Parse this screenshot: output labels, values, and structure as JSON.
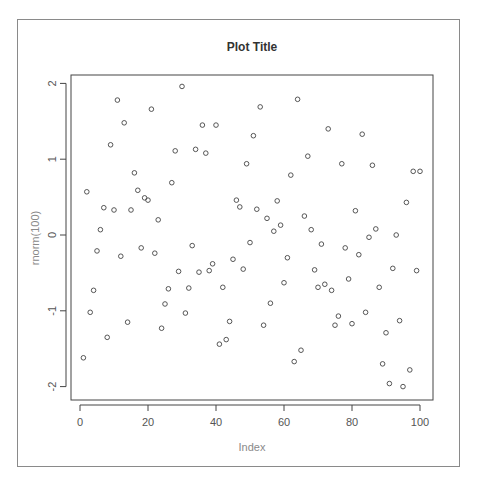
{
  "chart_data": {
    "type": "scatter",
    "title": "Plot Title",
    "xlabel": "Index",
    "ylabel": "rnorm(100)",
    "xlim": [
      -3,
      104
    ],
    "ylim": [
      -2.2,
      2.2
    ],
    "xticks": [
      0,
      20,
      40,
      60,
      80,
      100
    ],
    "yticks": [
      -2,
      -1,
      0,
      1,
      2
    ],
    "grid": false,
    "legend": null,
    "marker": "open-circle",
    "x": [
      1,
      2,
      3,
      4,
      5,
      6,
      7,
      8,
      9,
      10,
      11,
      12,
      13,
      14,
      15,
      16,
      17,
      18,
      19,
      20,
      21,
      22,
      23,
      24,
      25,
      26,
      27,
      28,
      29,
      30,
      31,
      32,
      33,
      34,
      35,
      36,
      37,
      38,
      39,
      40,
      41,
      42,
      43,
      44,
      45,
      46,
      47,
      48,
      49,
      50,
      51,
      52,
      53,
      54,
      55,
      56,
      57,
      58,
      59,
      60,
      61,
      62,
      63,
      64,
      65,
      66,
      67,
      68,
      69,
      70,
      71,
      72,
      73,
      74,
      75,
      76,
      77,
      78,
      79,
      80,
      81,
      82,
      83,
      84,
      85,
      86,
      87,
      88,
      89,
      90,
      91,
      92,
      93,
      94,
      95,
      96,
      97,
      98,
      99,
      100
    ],
    "y": [
      -1.62,
      0.57,
      -1.02,
      -0.73,
      -0.21,
      0.07,
      0.36,
      -1.35,
      1.19,
      0.33,
      1.78,
      -0.28,
      1.48,
      -1.15,
      0.33,
      0.82,
      0.59,
      -0.17,
      0.49,
      0.46,
      1.66,
      -0.24,
      0.2,
      -1.23,
      -0.91,
      -0.71,
      0.69,
      1.11,
      -0.48,
      1.96,
      -1.03,
      -0.7,
      -0.14,
      1.13,
      -0.49,
      1.45,
      1.08,
      -0.47,
      -0.38,
      1.45,
      -1.44,
      -0.69,
      -1.38,
      -1.14,
      -0.32,
      0.46,
      0.37,
      -0.45,
      0.94,
      -0.1,
      1.31,
      0.34,
      1.69,
      -1.19,
      0.22,
      -0.9,
      0.05,
      0.45,
      0.13,
      -0.63,
      -0.3,
      0.79,
      -1.67,
      1.79,
      -1.52,
      0.25,
      1.04,
      0.07,
      -0.46,
      -0.69,
      -0.12,
      -0.65,
      1.4,
      -0.73,
      -1.19,
      -1.07,
      0.94,
      -0.17,
      -0.58,
      -1.17,
      0.32,
      -0.26,
      1.33,
      -1.02,
      -0.03,
      0.92,
      0.08,
      -0.69,
      -1.7,
      -1.29,
      -1.96,
      -0.44,
      0.0,
      -1.13,
      -2.0,
      0.43,
      -1.78,
      0.84,
      -0.47,
      0.84
    ]
  },
  "colors": {
    "point_stroke": "#444444",
    "axis": "#444444",
    "frame": "#8a8a8a",
    "label": "#8a8a8a",
    "tick_text": "#555555",
    "title": "#333333"
  }
}
